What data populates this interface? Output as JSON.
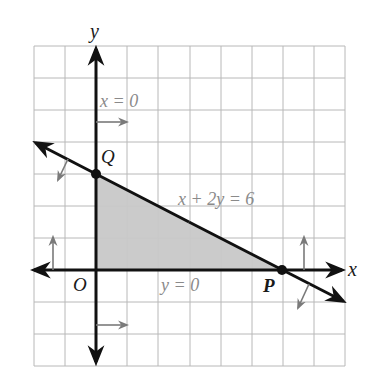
{
  "diagram": {
    "type": "linear-inequality-feasible-region",
    "grid": {
      "x_min": -2,
      "x_max": 8,
      "y_min": -3,
      "y_max": 7,
      "cell_px_x": 31.1,
      "cell_px_y": 32,
      "grid_color": "#b5b5b5"
    },
    "axes": {
      "x_label": "x",
      "y_label": "y",
      "origin_label": "O",
      "axis_color": "#111111"
    },
    "lines": [
      {
        "equation": "x + 2y = 6",
        "label": "x + 2y = 6",
        "from": [
          -2,
          4
        ],
        "to": [
          8,
          -1
        ],
        "shade_direction": "down-left"
      },
      {
        "equation": "x = 0",
        "label": "x = 0",
        "shade_direction": "right"
      },
      {
        "equation": "y = 0",
        "label": "y = 0",
        "shade_direction": "up"
      }
    ],
    "points": [
      {
        "name": "Q",
        "coords": [
          0,
          3
        ]
      },
      {
        "name": "P",
        "coords": [
          6,
          0
        ]
      },
      {
        "name": "O",
        "coords": [
          0,
          0
        ]
      }
    ],
    "feasible_region": {
      "vertices": [
        [
          0,
          0
        ],
        [
          6,
          0
        ],
        [
          0,
          3
        ]
      ],
      "fill_color": "#c8c8c8"
    },
    "labels": {
      "x_eq_0": "x = 0",
      "y_eq_0": "y = 0",
      "line": "x + 2y = 6",
      "Q": "Q",
      "P": "P",
      "O": "O",
      "x_axis": "x",
      "y_axis": "y"
    },
    "colors": {
      "annotation_gray": "#8a8a8a",
      "shade_gray": "#c8c8c8",
      "line_black": "#111111"
    }
  }
}
